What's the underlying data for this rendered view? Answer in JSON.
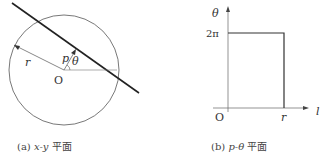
{
  "panel_a": {
    "caption_prefix": "(a)",
    "caption_math": "x-y",
    "caption_suffix": "平面",
    "labels": {
      "radius": "r",
      "distance": "p",
      "angle": "θ",
      "origin": "O"
    }
  },
  "panel_b": {
    "caption_prefix": "(b)",
    "caption_math": "p-θ",
    "caption_suffix": "平面",
    "labels": {
      "y_axis": "θ",
      "x_axis": "l",
      "y_tick": "2π",
      "x_tick": "r",
      "origin": "O"
    }
  },
  "colors": {
    "line": "#222222",
    "thin": "#555555",
    "text": "#333333"
  }
}
